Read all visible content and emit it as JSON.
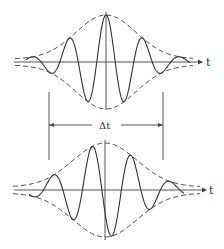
{
  "diagram": {
    "top_wave": {
      "axis_label": "t",
      "envelope_style": "dashed",
      "carrier_style": "solid"
    },
    "bottom_wave": {
      "axis_label": "t",
      "envelope_style": "dashed",
      "carrier_style": "solid"
    },
    "delay_marker": {
      "label": "Δt"
    },
    "colors": {
      "line": "#333333",
      "background": "#ffffff"
    }
  }
}
